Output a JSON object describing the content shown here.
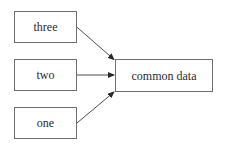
{
  "diagram": {
    "type": "flow",
    "nodes": [
      {
        "id": "three",
        "label": "three"
      },
      {
        "id": "two",
        "label": "two"
      },
      {
        "id": "one",
        "label": "one"
      },
      {
        "id": "common",
        "label": "common data"
      }
    ],
    "edges": [
      {
        "from": "three",
        "to": "common"
      },
      {
        "from": "two",
        "to": "common"
      },
      {
        "from": "one",
        "to": "common"
      }
    ],
    "colors": {
      "border": "#6e6e6e",
      "text": "#2b2b2b",
      "edge": "#3a3a3a",
      "background": "#ffffff"
    }
  }
}
